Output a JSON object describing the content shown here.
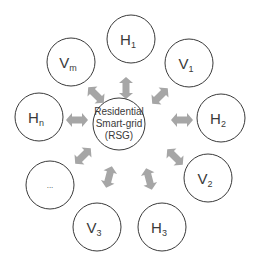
{
  "diagram": {
    "hub": {
      "lines": [
        "Residential",
        "Smart-grid",
        "(RSG)"
      ]
    },
    "nodes": [
      {
        "id": "H1",
        "base": "H",
        "sub": "1"
      },
      {
        "id": "V1",
        "base": "V",
        "sub": "1"
      },
      {
        "id": "H2",
        "base": "H",
        "sub": "2"
      },
      {
        "id": "V2",
        "base": "V",
        "sub": "2"
      },
      {
        "id": "H3",
        "base": "H",
        "sub": "3"
      },
      {
        "id": "V3",
        "base": "V",
        "sub": "3"
      },
      {
        "id": "ellipsis",
        "base": "...",
        "sub": ""
      },
      {
        "id": "Hn",
        "base": "H",
        "sub": "n"
      },
      {
        "id": "Vm",
        "base": "V",
        "sub": "m"
      }
    ],
    "arrow_color": "#a6a6a6",
    "stroke_color": "#3a3a3a"
  }
}
